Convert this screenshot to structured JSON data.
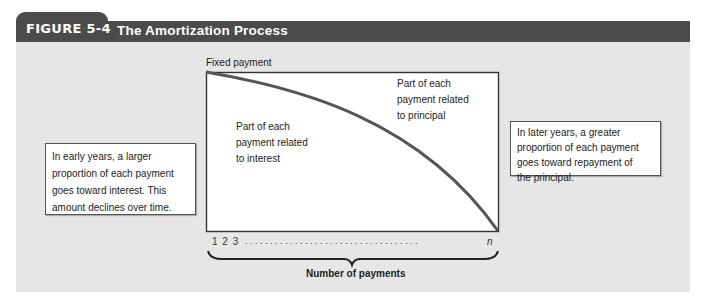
{
  "figure": {
    "number_label": "FIGURE 5-4",
    "title": "The Amortization Process",
    "colors": {
      "header_bg": "#4b4b4b",
      "header_text": "#ffffff",
      "panel_bg": "#e6e6e6",
      "chart_bg": "#ffffff",
      "curve": "#555555"
    }
  },
  "diagram": {
    "y_top_label": "Fixed payment",
    "region_principal_label": "Part of each payment related to principal",
    "region_principal_lines": [
      "Part of each",
      "payment related",
      "to principal"
    ],
    "region_interest_label": "Part of each payment related to interest",
    "region_interest_lines": [
      "Part of each",
      "payment related",
      "to interest"
    ],
    "x_ticks_start": "1 2 3",
    "x_ticks_dots": ". . . . . . . . . . . . . . . . . . . . . . . . . . . . . . . . . . .",
    "x_ticks_end": "n",
    "x_axis_label": "Number of payments"
  },
  "callouts": {
    "left": {
      "lines": [
        "In early years, a larger",
        "proportion of each payment",
        "goes toward interest. This",
        "amount declines over time."
      ]
    },
    "right": {
      "lines": [
        "In later years, a greater",
        "proportion of each payment",
        "goes toward repayment of",
        "the principal."
      ]
    }
  }
}
